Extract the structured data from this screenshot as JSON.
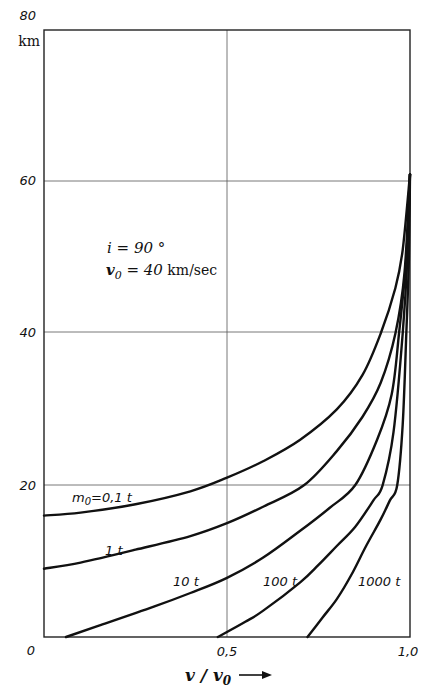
{
  "chart_data": {
    "type": "line",
    "title": "",
    "xlabel": "v/v0",
    "ylabel": "km",
    "xlim": [
      0,
      1.0
    ],
    "ylim": [
      0,
      80
    ],
    "x_ticks": [
      "0",
      "0,5",
      "1,0"
    ],
    "y_ticks": [
      "0",
      "20",
      "40",
      "60",
      "80"
    ],
    "y_unit": "km",
    "grid": true,
    "annotations": [
      "i = 90°",
      "v0 = 40 km/sec"
    ],
    "series": [
      {
        "name": "m0=0,1 t",
        "label": "m0=0,1 t",
        "points": [
          [
            0,
            16
          ],
          [
            0.1,
            16.4
          ],
          [
            0.25,
            17.5
          ],
          [
            0.4,
            19.2
          ],
          [
            0.5,
            21
          ],
          [
            0.6,
            23.2
          ],
          [
            0.7,
            26
          ],
          [
            0.8,
            30
          ],
          [
            0.87,
            34.5
          ],
          [
            0.92,
            40
          ],
          [
            0.96,
            46
          ],
          [
            0.98,
            51
          ],
          [
            1.0,
            61
          ]
        ]
      },
      {
        "name": "1 t",
        "label": "1 t",
        "points": [
          [
            0,
            9
          ],
          [
            0.1,
            9.8
          ],
          [
            0.25,
            11.5
          ],
          [
            0.4,
            13.3
          ],
          [
            0.5,
            15
          ],
          [
            0.6,
            17.2
          ],
          [
            0.71,
            20
          ],
          [
            0.8,
            24.5
          ],
          [
            0.87,
            29
          ],
          [
            0.92,
            33.5
          ],
          [
            0.96,
            40
          ],
          [
            0.985,
            48
          ],
          [
            1.0,
            61
          ]
        ]
      },
      {
        "name": "10 t",
        "label": "10 t",
        "points": [
          [
            0.06,
            0
          ],
          [
            0.15,
            1.5
          ],
          [
            0.3,
            4
          ],
          [
            0.4,
            5.8
          ],
          [
            0.5,
            7.8
          ],
          [
            0.6,
            10.5
          ],
          [
            0.7,
            14
          ],
          [
            0.78,
            17
          ],
          [
            0.85,
            20
          ],
          [
            0.91,
            26
          ],
          [
            0.95,
            32
          ],
          [
            0.97,
            40
          ],
          [
            0.99,
            50
          ],
          [
            1.0,
            61
          ]
        ]
      },
      {
        "name": "100 t",
        "label": "100 t",
        "points": [
          [
            0.475,
            0
          ],
          [
            0.55,
            2
          ],
          [
            0.6,
            3.5
          ],
          [
            0.7,
            7.2
          ],
          [
            0.75,
            9.5
          ],
          [
            0.8,
            12
          ],
          [
            0.85,
            14.5
          ],
          [
            0.9,
            18
          ],
          [
            0.925,
            20
          ],
          [
            0.955,
            27
          ],
          [
            0.98,
            40
          ],
          [
            0.993,
            50
          ],
          [
            1.0,
            61
          ]
        ]
      },
      {
        "name": "1000 t",
        "label": "1000 t",
        "points": [
          [
            0.72,
            0
          ],
          [
            0.76,
            2.5
          ],
          [
            0.8,
            5
          ],
          [
            0.84,
            8.2
          ],
          [
            0.88,
            12
          ],
          [
            0.92,
            15.5
          ],
          [
            0.945,
            18
          ],
          [
            0.965,
            20
          ],
          [
            0.98,
            28
          ],
          [
            0.99,
            40
          ],
          [
            0.997,
            50
          ],
          [
            1.0,
            61
          ]
        ]
      }
    ]
  },
  "labels": {
    "y80": "80",
    "y60": "60",
    "y40": "40",
    "y20": "20",
    "y0": "0",
    "x05": "0,5",
    "x10": "1,0",
    "unit": "km",
    "annot_i": "i = 90 °",
    "annot_v0_lhs": "v",
    "annot_v0_sub": "0",
    "annot_v0_rhs": " = 40",
    "annot_v0_unit": " km/sec",
    "xlabel_main": "v / v",
    "xlabel_sub": "0",
    "arrow": "⟶",
    "curve_01": "m",
    "curve_01_sub": "0",
    "curve_01_rest": "=0,1 t",
    "curve_1": "1 t",
    "curve_10": "10 t",
    "curve_100": "100 t",
    "curve_1000": "1000 t"
  }
}
